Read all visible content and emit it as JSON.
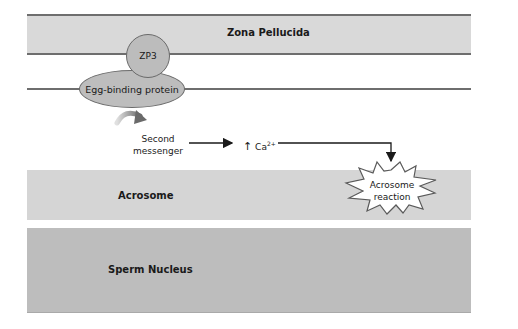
{
  "diagram": {
    "type": "biological pathway",
    "layers": {
      "zona_pellucida": "Zona Pellucida",
      "acrosome": "Acrosome",
      "sperm_nucleus": "Sperm Nucleus"
    },
    "molecules": {
      "zp3": "ZP3",
      "egg_binding_protein": "Egg-binding protein"
    },
    "steps": {
      "second_messenger_line1": "Second",
      "second_messenger_line2": "messenger",
      "calcium_up_arrow": "↑",
      "calcium": "Ca",
      "calcium_charge": "2+",
      "acrosome_reaction_line1": "Acrosome",
      "acrosome_reaction_line2": "reaction"
    },
    "colors": {
      "zona_fill": "#d9d9d9",
      "acrosome_fill": "#d5d5d5",
      "nucleus_fill": "#bdbdbd",
      "membrane_line": "#6e6e6e",
      "protein_fill": "#bdbdbd"
    }
  }
}
